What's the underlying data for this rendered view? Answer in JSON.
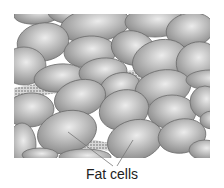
{
  "diagram": {
    "title": "",
    "label": "Fat cells",
    "colors": {
      "cell_fill": "#a8a8a8",
      "cell_highlight": "#e6e6e6",
      "cell_edge": "#6e6e6e",
      "matrix": "#8a8a8a",
      "leader_line": "#777777"
    },
    "cells": [
      {
        "cx": 38,
        "cy": 14,
        "rx": 24,
        "ry": 10,
        "r": -5
      },
      {
        "cx": 70,
        "cy": 14,
        "rx": 22,
        "ry": 10,
        "r": 5
      },
      {
        "cx": 95,
        "cy": 25,
        "rx": 35,
        "ry": 17,
        "r": -8
      },
      {
        "cx": 155,
        "cy": 22,
        "rx": 30,
        "ry": 15,
        "r": 0
      },
      {
        "cx": 190,
        "cy": 30,
        "rx": 24,
        "ry": 17,
        "r": -10
      },
      {
        "cx": 43,
        "cy": 42,
        "rx": 26,
        "ry": 19,
        "r": -10
      },
      {
        "cx": 90,
        "cy": 52,
        "rx": 26,
        "ry": 16,
        "r": -3
      },
      {
        "cx": 133,
        "cy": 48,
        "rx": 22,
        "ry": 17,
        "r": 15
      },
      {
        "cx": 160,
        "cy": 60,
        "rx": 28,
        "ry": 20,
        "r": -15
      },
      {
        "cx": 198,
        "cy": 62,
        "rx": 22,
        "ry": 20,
        "r": -20
      },
      {
        "cx": 24,
        "cy": 66,
        "rx": 22,
        "ry": 19,
        "r": 0
      },
      {
        "cx": 60,
        "cy": 78,
        "rx": 26,
        "ry": 14,
        "r": -5
      },
      {
        "cx": 103,
        "cy": 72,
        "rx": 24,
        "ry": 14,
        "r": -5
      },
      {
        "cx": 120,
        "cy": 87,
        "rx": 20,
        "ry": 14,
        "r": -15
      },
      {
        "cx": 163,
        "cy": 88,
        "rx": 28,
        "ry": 18,
        "r": -10
      },
      {
        "cx": 210,
        "cy": 80,
        "rx": 24,
        "ry": 10,
        "r": 0
      },
      {
        "cx": 80,
        "cy": 98,
        "rx": 26,
        "ry": 18,
        "r": -15
      },
      {
        "cx": 30,
        "cy": 110,
        "rx": 24,
        "ry": 17,
        "r": -5
      },
      {
        "cx": 124,
        "cy": 110,
        "rx": 25,
        "ry": 20,
        "r": -15
      },
      {
        "cx": 172,
        "cy": 112,
        "rx": 24,
        "ry": 17,
        "r": 0
      },
      {
        "cx": 205,
        "cy": 102,
        "rx": 15,
        "ry": 16,
        "r": 0
      },
      {
        "cx": 22,
        "cy": 145,
        "rx": 14,
        "ry": 22,
        "r": 0
      },
      {
        "cx": 67,
        "cy": 132,
        "rx": 30,
        "ry": 21,
        "r": -15
      },
      {
        "cx": 135,
        "cy": 140,
        "rx": 28,
        "ry": 20,
        "r": -15
      },
      {
        "cx": 182,
        "cy": 136,
        "rx": 24,
        "ry": 17,
        "r": -10
      },
      {
        "cx": 212,
        "cy": 120,
        "rx": 12,
        "ry": 9,
        "r": 0
      },
      {
        "cx": 85,
        "cy": 157,
        "rx": 26,
        "ry": 8,
        "r": 0
      },
      {
        "cx": 205,
        "cy": 150,
        "rx": 16,
        "ry": 10,
        "r": 0
      },
      {
        "cx": 40,
        "cy": 155,
        "rx": 18,
        "ry": 7,
        "r": 0
      }
    ],
    "leaders": [
      {
        "x1": 68,
        "y1": 132,
        "x2": 113,
        "y2": 166
      },
      {
        "x1": 133,
        "y1": 140,
        "x2": 117,
        "y2": 166
      }
    ]
  }
}
